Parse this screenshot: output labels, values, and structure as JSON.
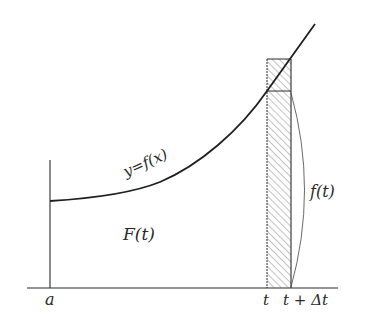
{
  "diagram": {
    "labels": {
      "curve": "y=f(x)",
      "area": "F(t)",
      "height": "f(t)",
      "x_a": "a",
      "x_t": "t",
      "x_t_dt": "t + Δt"
    },
    "colors": {
      "ink": "#2a2a2a",
      "hatch": "#555555",
      "background": "#ffffff"
    }
  }
}
